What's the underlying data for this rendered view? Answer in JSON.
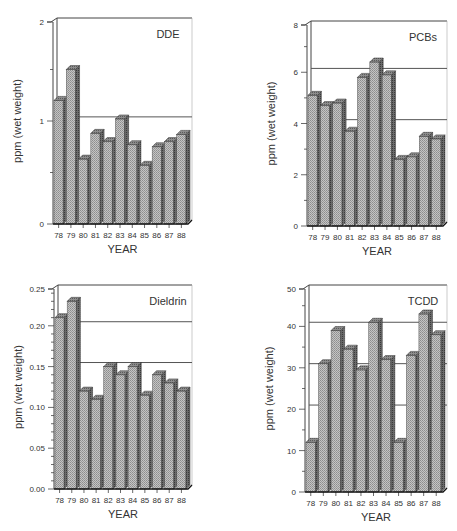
{
  "colors": {
    "bar_front": "#b8b8b8",
    "bar_side": "#6a6a6a",
    "bar_top": "#8a8a8a",
    "frame": "#444444",
    "ref_line": "#555555"
  },
  "chart_data": [
    {
      "type": "bar",
      "title": "DDE",
      "xlabel": "YEAR",
      "ylabel": "ppm (wet weight)",
      "categories": [
        "78",
        "79",
        "80",
        "81",
        "82",
        "83",
        "84",
        "85",
        "86",
        "87",
        "88"
      ],
      "values": [
        1.2,
        1.5,
        0.63,
        0.88,
        0.8,
        1.02,
        0.77,
        0.57,
        0.75,
        0.8,
        0.87
      ],
      "ylim": [
        0,
        2
      ],
      "yticks": [
        "0",
        "1",
        "2"
      ],
      "reference_lines": [
        1.04
      ],
      "grid": false,
      "style": "3d-bar"
    },
    {
      "type": "bar",
      "title": "PCBs",
      "xlabel": "YEAR",
      "ylabel": "ppm (wet weight)",
      "categories": [
        "78",
        "79",
        "80",
        "81",
        "82",
        "83",
        "84",
        "85",
        "86",
        "87",
        "88"
      ],
      "values": [
        5.1,
        4.7,
        4.8,
        3.7,
        5.8,
        6.4,
        5.9,
        2.6,
        2.7,
        3.5,
        3.4
      ],
      "ylim": [
        0,
        8
      ],
      "yticks": [
        "0",
        "2",
        "4",
        "6",
        "8"
      ],
      "reference_lines": [
        6.15,
        4.15
      ],
      "grid": false,
      "style": "3d-bar"
    },
    {
      "type": "bar",
      "title": "Dieldrin",
      "xlabel": "YEAR",
      "ylabel": "ppm (wet weight)",
      "categories": [
        "78",
        "79",
        "80",
        "81",
        "82",
        "83",
        "84",
        "85",
        "86",
        "87",
        "88"
      ],
      "values": [
        0.21,
        0.23,
        0.12,
        0.11,
        0.15,
        0.14,
        0.15,
        0.115,
        0.14,
        0.13,
        0.12
      ],
      "ylim": [
        0,
        0.25
      ],
      "yticks": [
        "0.00",
        "0.05",
        "0.10",
        "0.15",
        "0.20",
        "0.25"
      ],
      "reference_lines": [
        0.205,
        0.155
      ],
      "grid": false,
      "style": "3d-bar"
    },
    {
      "type": "bar",
      "title": "TCDD",
      "xlabel": "YEAR",
      "ylabel": "ppm (wet weight)",
      "categories": [
        "78",
        "79",
        "80",
        "81",
        "82",
        "83",
        "84",
        "85",
        "86",
        "87",
        "88"
      ],
      "values": [
        12,
        31,
        39,
        34.5,
        29.5,
        41,
        32,
        12,
        33,
        43,
        38
      ],
      "ylim": [
        0,
        50
      ],
      "yticks": [
        "0",
        "10",
        "20",
        "30",
        "40",
        "50"
      ],
      "reference_lines": [
        41,
        31,
        21
      ],
      "grid": false,
      "style": "3d-bar"
    }
  ],
  "layout": [
    {
      "x0": 53,
      "x1": 192,
      "ytop": 18,
      "ybot": 224,
      "minor_per_major": 2
    },
    {
      "x0": 307,
      "x1": 447,
      "ytop": 21,
      "ybot": 226,
      "minor_per_major": 2
    },
    {
      "x0": 54,
      "x1": 192,
      "ytop": 285,
      "ybot": 489,
      "minor_per_major": 5
    },
    {
      "x0": 305,
      "x1": 447,
      "ytop": 285,
      "ybot": 492,
      "minor_per_major": 2
    }
  ]
}
